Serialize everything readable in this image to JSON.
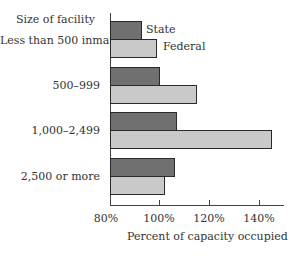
{
  "chart_data": {
    "type": "bar",
    "orientation": "horizontal",
    "title": "",
    "category_axis_title": "Size of facility",
    "categories": [
      "Less than 500 inmates",
      "500–999",
      "1,000–2,499",
      "2,500 or more"
    ],
    "series": [
      {
        "name": "State",
        "color": "#707070",
        "values": [
          93,
          100,
          107,
          106
        ]
      },
      {
        "name": "Federal",
        "color": "#c9c9c9",
        "values": [
          99,
          115,
          145,
          102
        ]
      }
    ],
    "xlabel": "Percent of capacity occupied",
    "ylabel": "Size of facility",
    "xlim": [
      80,
      150
    ],
    "xticks": [
      "80%",
      "100%",
      "120%",
      "140%"
    ],
    "xtick_values": [
      80,
      100,
      120,
      140
    ],
    "legend_position": "inline labels next to first category bars",
    "grid": false
  },
  "labels": {
    "axis_title": "Size of facility",
    "cat0": "Less than 500 inmates",
    "cat1": "500–999",
    "cat2": "1,000–2,499",
    "cat3": "2,500 or more",
    "state": "State",
    "federal": "Federal",
    "tick0": "80%",
    "tick1": "100%",
    "tick2": "120%",
    "tick3": "140%",
    "xlabel": "Percent of capacity occupied"
  }
}
